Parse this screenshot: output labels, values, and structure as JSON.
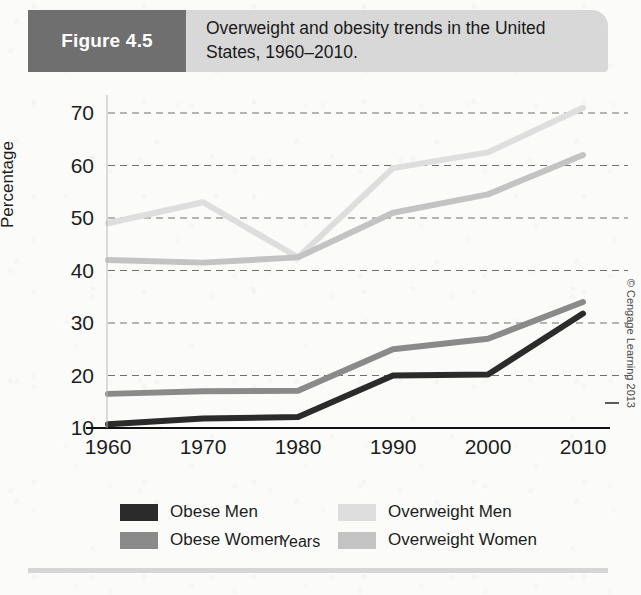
{
  "header": {
    "figure_number": "Figure 4.5",
    "title": "Overweight and obesity trends in the United States, 1960–2010.",
    "box_color": "#6f6f6f",
    "band_color": "#d8d8d8"
  },
  "copyright": "© Cengage Learning 2013",
  "chart_data": {
    "type": "line",
    "title": "Overweight and obesity trends in the United States, 1960–2010.",
    "xlabel": "Years",
    "ylabel": "Percentage",
    "x": [
      1960,
      1970,
      1980,
      1990,
      2000,
      2010
    ],
    "categories": [
      "1960",
      "1970",
      "1980",
      "1990",
      "2000",
      "2010"
    ],
    "xlim": [
      1960,
      2010
    ],
    "ylim": [
      10,
      70
    ],
    "yticks": [
      10,
      20,
      30,
      40,
      50,
      60,
      70
    ],
    "ytick_labels": [
      "10",
      "20",
      "30",
      "40",
      "50",
      "60",
      "70"
    ],
    "grid": "horizontal-dashed",
    "legend_position": "below-axes",
    "series": [
      {
        "name": "Obese Men",
        "color": "#2b2b2b",
        "values": [
          10.7,
          11.8,
          12.1,
          20.0,
          20.2,
          31.8
        ]
      },
      {
        "name": "Obese Women",
        "color": "#8a8a8a",
        "values": [
          16.5,
          17.0,
          17.1,
          25.0,
          27.0,
          34.0
        ]
      },
      {
        "name": "Overweight Men",
        "color": "#dedede",
        "values": [
          49.0,
          53.0,
          42.5,
          59.5,
          62.5,
          71.0
        ]
      },
      {
        "name": "Overweight Women",
        "color": "#c3c3c3",
        "values": [
          42.0,
          41.5,
          42.5,
          51.0,
          54.5,
          62.0
        ]
      }
    ]
  },
  "legend": [
    {
      "label": "Obese Men",
      "color": "#2b2b2b"
    },
    {
      "label": "Overweight Men",
      "color": "#dedede"
    },
    {
      "label": "Obese Women",
      "color": "#8a8a8a"
    },
    {
      "label": "Overweight Women",
      "color": "#c3c3c3"
    }
  ]
}
